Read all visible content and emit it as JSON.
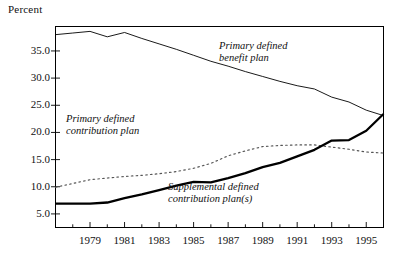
{
  "axis_title": "Percent",
  "y_ticks": [
    "35.0",
    "30.0",
    "25.0",
    "20.0",
    "15.0",
    "10.0",
    "5.0"
  ],
  "x_ticks": [
    "1979",
    "1981",
    "1983",
    "1985",
    "1987",
    "1989",
    "1991",
    "1993",
    "1995"
  ],
  "annotations": {
    "db": {
      "line1": "Primary defined",
      "line2": "benefit plan"
    },
    "pdc": {
      "line1": "Primary defined",
      "line2": "contribution plan"
    },
    "sdc": {
      "line1": "Supplemental defined",
      "line2": "contribution plan(s)"
    }
  },
  "colors": {
    "axis": "#000000",
    "defined_benefit": "#000000",
    "primary_dc": "#555555",
    "supplemental_dc": "#000000",
    "background": "#ffffff"
  },
  "chart_data": {
    "type": "line",
    "title": "",
    "subtitle": "",
    "xlabel": "",
    "ylabel": "Percent",
    "grid": false,
    "legend_position": "inline-annotations",
    "xlim": [
      1977,
      1996
    ],
    "ylim": [
      2.5,
      39.5
    ],
    "y_tick_values": [
      35.0,
      30.0,
      25.0,
      20.0,
      15.0,
      10.0,
      5.0
    ],
    "x_tick_values": [
      1979,
      1981,
      1983,
      1985,
      1987,
      1989,
      1991,
      1993,
      1995
    ],
    "x": [
      1977,
      1978,
      1979,
      1980,
      1981,
      1982,
      1983,
      1984,
      1985,
      1986,
      1987,
      1988,
      1989,
      1990,
      1991,
      1992,
      1993,
      1994,
      1995,
      1996
    ],
    "series": [
      {
        "name": "Primary defined benefit plan",
        "style": "thin-solid",
        "values": [
          38.0,
          38.3,
          38.6,
          37.6,
          38.4,
          37.3,
          36.3,
          35.3,
          34.2,
          33.1,
          32.2,
          31.2,
          30.3,
          29.4,
          28.6,
          28.0,
          26.5,
          25.6,
          24.1,
          23.1
        ]
      },
      {
        "name": "Primary defined contribution plan",
        "style": "dotted",
        "values": [
          9.9,
          10.6,
          11.3,
          11.6,
          11.9,
          12.1,
          12.4,
          12.8,
          13.4,
          14.3,
          15.7,
          16.6,
          17.4,
          17.6,
          17.7,
          17.7,
          17.3,
          16.9,
          16.4,
          16.2
        ]
      },
      {
        "name": "Supplemental defined contribution plan(s)",
        "style": "thick-solid",
        "values": [
          6.9,
          6.9,
          6.9,
          7.1,
          7.9,
          8.6,
          9.4,
          10.2,
          10.9,
          10.8,
          11.6,
          12.5,
          13.6,
          14.4,
          15.6,
          16.8,
          18.5,
          18.6,
          20.3,
          23.4
        ]
      }
    ]
  }
}
